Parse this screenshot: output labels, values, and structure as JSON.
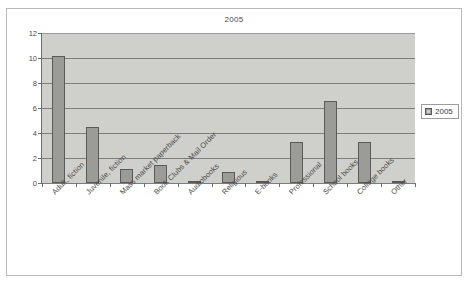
{
  "chart_data": {
    "type": "bar",
    "title": "2005",
    "xlabel": "",
    "ylabel": "",
    "ylim": [
      0,
      12
    ],
    "yticks": [
      0,
      2,
      4,
      6,
      8,
      10,
      12
    ],
    "grid": true,
    "legend_position": "right",
    "legend_entries": [
      "2005"
    ],
    "categories": [
      "Adult, fiction",
      "Juvenile, fiction",
      "Mass market paperback",
      "Book Clubs & Mail Order",
      "Audiobooks",
      "Religious",
      "E-books",
      "Professional",
      "School books",
      "College books",
      "Other"
    ],
    "series": [
      {
        "name": "2005",
        "color": "#9b9b98",
        "values": [
          10.15,
          4.5,
          1.1,
          1.45,
          0.2,
          0.85,
          0.18,
          3.25,
          6.55,
          3.3,
          0.15
        ]
      }
    ]
  },
  "legend": {
    "label": "2005",
    "swatch_color": "#9b9b98"
  },
  "axes": {
    "y_tick_labels": [
      "0",
      "2",
      "4",
      "6",
      "8",
      "10",
      "12"
    ]
  }
}
